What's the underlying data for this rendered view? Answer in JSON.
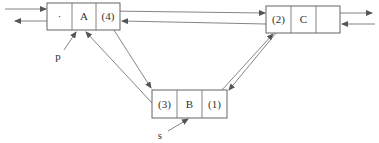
{
  "diagram": {
    "type": "doubly-linked-list-insertion",
    "nodes": [
      {
        "id": "A",
        "cells": [
          "·",
          "A",
          "(4)"
        ]
      },
      {
        "id": "C",
        "cells": [
          "(2)",
          "C",
          ""
        ]
      },
      {
        "id": "B",
        "cells": [
          "(3)",
          "B",
          "(1)"
        ]
      }
    ],
    "pointers": [
      {
        "label": "p",
        "target": "A"
      },
      {
        "label": "s",
        "target": "B"
      }
    ],
    "colors": {
      "stroke": "#555555",
      "text": "#333333",
      "background": "#ffffff"
    }
  }
}
